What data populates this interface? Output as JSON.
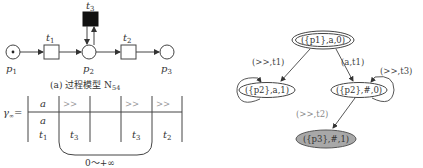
{
  "petri_net": {
    "places": [
      {
        "id": "p1",
        "label": "p",
        "sub": "1",
        "token": true
      },
      {
        "id": "p2",
        "label": "p",
        "sub": "2",
        "token": false
      },
      {
        "id": "p3",
        "label": "p",
        "sub": "3",
        "token": false
      }
    ],
    "transitions": [
      {
        "id": "t1",
        "label": "t",
        "sub": "1",
        "filled": false
      },
      {
        "id": "t3",
        "label": "t",
        "sub": "3",
        "filled": true
      },
      {
        "id": "t2",
        "label": "t",
        "sub": "2",
        "filled": false
      }
    ],
    "caption": "(a) 过程模型 N",
    "caption_sub": "54"
  },
  "alignment": {
    "gamma_label": "γ",
    "gamma_sub": "∞",
    "equals": "=",
    "top_row": [
      "a",
      ">>",
      "",
      ">>",
      ">>"
    ],
    "bottom_row_a": [
      "a",
      "",
      "",
      "",
      ""
    ],
    "bottom_row_t": [
      "t1",
      "t3",
      "",
      "t3",
      "t2"
    ],
    "repeat_label": "0～+∞"
  },
  "state_graph": {
    "nodes": [
      {
        "id": "n0",
        "text": "({p1},a,0)",
        "style": "double"
      },
      {
        "id": "n1",
        "text": "({p2},a,1)",
        "style": "single"
      },
      {
        "id": "n2",
        "text": "({p2},#,0)",
        "style": "single"
      },
      {
        "id": "n3",
        "text": "({p3},#,1)",
        "style": "filled"
      }
    ],
    "edges": [
      {
        "from": "n0",
        "to": "n1",
        "label": "(>>,t1)"
      },
      {
        "from": "n0",
        "to": "n2",
        "label": "(a,t1)"
      },
      {
        "from": "n2",
        "to": "n2",
        "label": "(>>,t3)"
      },
      {
        "from": "n1",
        "to": "n1",
        "label": ""
      },
      {
        "from": "n2",
        "to": "n3",
        "label": "(>>,t2)"
      }
    ]
  }
}
